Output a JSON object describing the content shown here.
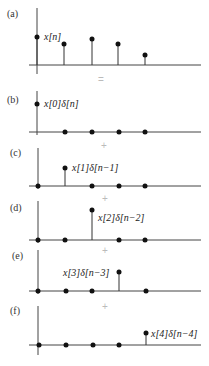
{
  "figure": {
    "operators": [
      "=",
      "+",
      "+",
      "+",
      "+"
    ],
    "panels": [
      {
        "label": "(a)",
        "signal_label": "x[n]",
        "values": [
          0.8,
          0.6,
          0.7,
          0.6,
          0.3
        ]
      },
      {
        "label": "(b)",
        "signal_label": "x[0]δ[n]",
        "active_index": 0
      },
      {
        "label": "(c)",
        "signal_label": "x[1]δ[n−1]",
        "active_index": 1
      },
      {
        "label": "(d)",
        "signal_label": "x[2]δ[n−2]",
        "active_index": 2
      },
      {
        "label": "(e)",
        "signal_label": "x[3]δ[n−3]",
        "active_index": 3
      },
      {
        "label": "(f)",
        "signal_label": "x[4]δ[n−4]",
        "active_index": 4
      }
    ]
  },
  "colors": {
    "axis": "#444444",
    "dot": "#111111",
    "operator": "#bbbbbb"
  }
}
